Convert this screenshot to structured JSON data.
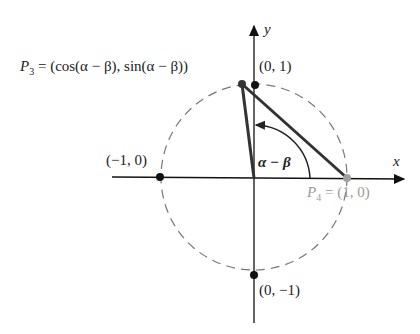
{
  "diagram": {
    "axes": {
      "x_label": "x",
      "y_label": "y"
    },
    "points": {
      "p3_label": "P",
      "p3_sub": "3",
      "p3_expr": " = (cos(α − β), sin(α − β))",
      "top": "(0, 1)",
      "left": "(−1, 0)",
      "bottom": "(0, −1)",
      "p4_label": "P",
      "p4_sub": "4",
      "p4_expr": " = (1, 0)"
    },
    "angle_label": "α − β",
    "colors": {
      "axis": "#111111",
      "circle": "#777777",
      "triangle": "#333333",
      "p4": "#a0a0a0"
    }
  }
}
